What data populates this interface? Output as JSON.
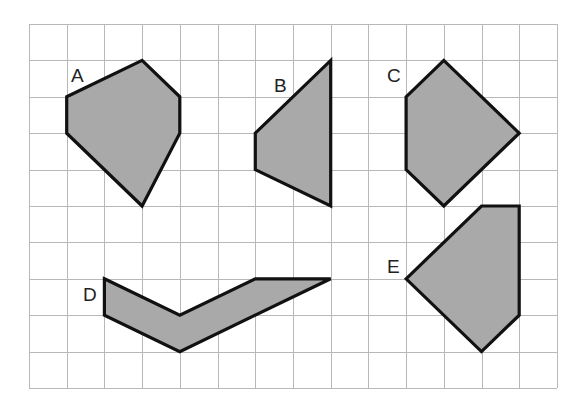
{
  "figure": {
    "grid": {
      "columns": 14,
      "rows": 10,
      "origin_px": [
        29,
        24
      ],
      "cell_w": 37.71,
      "cell_h": 36.4,
      "line_color": "#b8b8b8"
    },
    "fill_color": "#a9a9a9",
    "stroke_color": "#111111",
    "shapes": [
      {
        "label": "A",
        "vertices": [
          [
            1,
            2
          ],
          [
            3,
            1
          ],
          [
            4,
            2
          ],
          [
            4,
            3
          ],
          [
            3,
            5
          ],
          [
            1,
            3
          ]
        ],
        "label_px": [
          71,
          82
        ]
      },
      {
        "label": "B",
        "vertices": [
          [
            6,
            3
          ],
          [
            8,
            1
          ],
          [
            8,
            5
          ],
          [
            6,
            4
          ]
        ],
        "label_px": [
          274,
          92
        ]
      },
      {
        "label": "C",
        "vertices": [
          [
            10,
            2
          ],
          [
            11,
            1
          ],
          [
            13,
            3
          ],
          [
            11,
            5
          ],
          [
            10,
            4
          ]
        ],
        "label_px": [
          387,
          82
        ]
      },
      {
        "label": "D",
        "vertices": [
          [
            2,
            7
          ],
          [
            4,
            8
          ],
          [
            6,
            7
          ],
          [
            8,
            7
          ],
          [
            4,
            9
          ],
          [
            2,
            8
          ]
        ],
        "label_px": [
          83,
          301
        ]
      },
      {
        "label": "E",
        "vertices": [
          [
            10,
            7
          ],
          [
            12,
            5
          ],
          [
            13,
            5
          ],
          [
            13,
            8
          ],
          [
            12,
            9
          ]
        ],
        "label_px": [
          387,
          273
        ]
      }
    ]
  }
}
